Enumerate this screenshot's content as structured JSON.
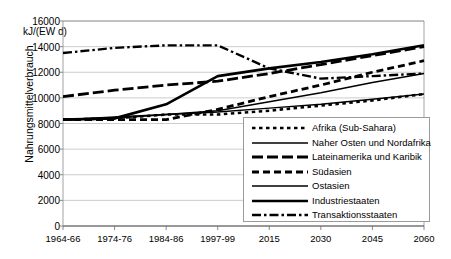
{
  "chart_data": {
    "type": "line",
    "title": "",
    "xlabel": "",
    "ylabel": "Nahrungsmittelverbrauch",
    "yunit": "kJ/(EW d)",
    "ylim": [
      0,
      16000
    ],
    "ytick_step": 2000,
    "yticks": [
      "0",
      "2000",
      "4000",
      "6000",
      "8000",
      "10000",
      "12000",
      "14000",
      "16000"
    ],
    "grid": true,
    "legend_position": "inside-bottom-right",
    "categories": [
      "1964-66",
      "1974-76",
      "1984-86",
      "1997-99",
      "2015",
      "2030",
      "2045",
      "2060"
    ],
    "series": [
      {
        "name": "Afrika (Sub-Sahara)",
        "style": "dotted",
        "values": [
          8300,
          8400,
          8700,
          8700,
          9000,
          9400,
          9800,
          10300
        ]
      },
      {
        "name": "Naher Osten und Nordafrika",
        "style": "solid-thin",
        "values": [
          8300,
          8500,
          8700,
          8900,
          9200,
          9500,
          9900,
          10300
        ]
      },
      {
        "name": "Lateinamerika und Karibik",
        "style": "dashed-long",
        "values": [
          10100,
          10600,
          11000,
          11300,
          11900,
          12600,
          13300,
          14000
        ]
      },
      {
        "name": "Südasien",
        "style": "dashed-medium",
        "values": [
          8300,
          8300,
          8300,
          9100,
          10100,
          11000,
          12000,
          12900
        ]
      },
      {
        "name": "Ostasien",
        "style": "solid-thin",
        "values": [
          8300,
          8400,
          8700,
          9000,
          9700,
          10400,
          11200,
          11900
        ]
      },
      {
        "name": "Industriestaaten",
        "style": "solid-thick",
        "values": [
          8300,
          8400,
          9500,
          11700,
          12300,
          12800,
          13400,
          14100
        ]
      },
      {
        "name": "Transaktionsstaaten",
        "style": "dash-dot",
        "values": [
          13500,
          13900,
          14100,
          14100,
          12300,
          11500,
          11700,
          11900
        ]
      }
    ]
  },
  "legend": {
    "items": [
      {
        "label": "Afrika (Sub-Sahara)"
      },
      {
        "label": "Naher Osten und Nordafrika"
      },
      {
        "label": "Lateinamerika und Karibik"
      },
      {
        "label": "Südasien"
      },
      {
        "label": "Ostasien"
      },
      {
        "label": "Industriestaaten"
      },
      {
        "label": "Transaktionsstaaten"
      }
    ]
  }
}
